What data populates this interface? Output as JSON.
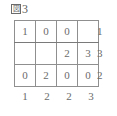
{
  "figure": {
    "caption_glyph": "図",
    "caption_label": "3",
    "caption_full": "図3"
  },
  "grid": {
    "columns": 4,
    "rows": 3,
    "cells": [
      [
        "1",
        "0",
        "0",
        ""
      ],
      [
        "",
        "",
        "2",
        "3"
      ],
      [
        "0",
        "2",
        "0",
        "0"
      ]
    ],
    "row_clues": [
      "1",
      "3",
      "2"
    ],
    "column_clues": [
      "1",
      "2",
      "2",
      "3"
    ]
  },
  "colors": {
    "text": "#6b6b6b",
    "grid_line": "#8f8f8f",
    "background": "#ffffff"
  },
  "chart_data": {
    "type": "table",
    "categories": [
      "col1",
      "col2",
      "col3",
      "col4"
    ],
    "series": [
      {
        "name": "row1",
        "values": [
          1,
          0,
          0,
          null
        ]
      },
      {
        "name": "row2",
        "values": [
          null,
          null,
          2,
          3
        ]
      },
      {
        "name": "row3",
        "values": [
          0,
          2,
          0,
          0
        ]
      }
    ],
    "row_totals": [
      1,
      3,
      2
    ],
    "column_totals": [
      1,
      2,
      2,
      3
    ],
    "xlabel": "",
    "ylabel": "",
    "grid": true,
    "legend": "none"
  }
}
